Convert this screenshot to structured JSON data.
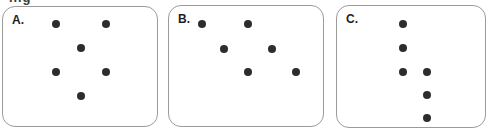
{
  "figure": {
    "clipped_text_fragment": "ing",
    "colors": {
      "background": "#ffffff",
      "panel_border": "#9b9b9b",
      "dot": "#2d2d2d",
      "label_text": "#1f1f1f"
    },
    "dot_count_per_panel": 6
  },
  "panels": [
    {
      "id": "A",
      "label": "A.",
      "dots": [
        {
          "x": 53,
          "y": 17
        },
        {
          "x": 103,
          "y": 17
        },
        {
          "x": 78,
          "y": 41
        },
        {
          "x": 53,
          "y": 65
        },
        {
          "x": 103,
          "y": 65
        },
        {
          "x": 78,
          "y": 89
        }
      ]
    },
    {
      "id": "B",
      "label": "B.",
      "dots": [
        {
          "x": 33,
          "y": 18
        },
        {
          "x": 79,
          "y": 18
        },
        {
          "x": 55,
          "y": 43
        },
        {
          "x": 103,
          "y": 43
        },
        {
          "x": 79,
          "y": 66
        },
        {
          "x": 127,
          "y": 66
        }
      ]
    },
    {
      "id": "C",
      "label": "C.",
      "dots": [
        {
          "x": 66,
          "y": 18
        },
        {
          "x": 66,
          "y": 42
        },
        {
          "x": 66,
          "y": 66
        },
        {
          "x": 90,
          "y": 66
        },
        {
          "x": 90,
          "y": 89
        },
        {
          "x": 90,
          "y": 112
        }
      ]
    }
  ]
}
